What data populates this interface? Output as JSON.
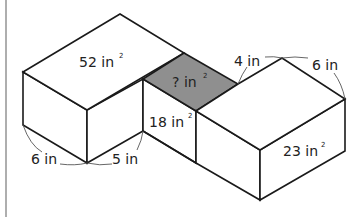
{
  "diagram": {
    "colors": {
      "line": "#1a1a1a",
      "shaded_face": "#8f8f8f",
      "background": "#ffffff",
      "left_border": "#9a9a9a"
    },
    "faces": {
      "left_top": {
        "value": "52 in",
        "exp": "2"
      },
      "unknown": {
        "value": "? in",
        "exp": "2"
      },
      "middle_front": {
        "value": "18 in",
        "exp": "2"
      },
      "right_front": {
        "value": "23 in",
        "exp": "2"
      }
    },
    "dimensions": {
      "left_depth": "6 in",
      "left_width": "5 in",
      "right_top_left": "4 in",
      "right_top_right": "6 in"
    }
  }
}
